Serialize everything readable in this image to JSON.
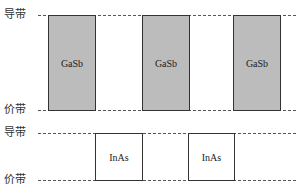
{
  "diagram": {
    "top_band": {
      "conduction_label": "导带",
      "valence_label": "价带",
      "material": "GaSb",
      "fill_color": "#bcbcbc",
      "boxes": [
        "GaSb",
        "GaSb",
        "GaSb"
      ]
    },
    "bottom_band": {
      "conduction_label": "导带",
      "valence_label": "价带",
      "material": "InAs",
      "fill_color": "#ffffff",
      "boxes": [
        "InAs",
        "InAs"
      ]
    }
  }
}
